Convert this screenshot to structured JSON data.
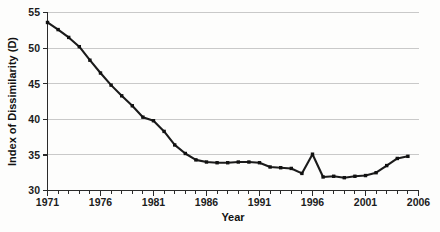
{
  "chart_data": {
    "type": "line",
    "title": "",
    "xlabel": "Year",
    "ylabel": "Index of Dissimilarity (D)",
    "xlim": [
      1971,
      2006
    ],
    "ylim": [
      30,
      55
    ],
    "grid": true,
    "grid_axis": "y",
    "legend": "none",
    "marker": "square",
    "line_color": "#1b1b1b",
    "gridline_color": "#c9c9c9",
    "background_color": "#fdfdfc",
    "x_tick_labels": [
      "1971",
      "1976",
      "1981",
      "1986",
      "1991",
      "1996",
      "2001",
      "2006"
    ],
    "x_tick_values": [
      1971,
      1976,
      1981,
      1986,
      1991,
      1996,
      2001,
      2006
    ],
    "x_minor_tick_interval": 1,
    "y_tick_labels": [
      "30",
      "35",
      "40",
      "45",
      "50",
      "55"
    ],
    "y_tick_values": [
      30,
      35,
      40,
      45,
      50,
      55
    ],
    "x": [
      1971,
      1972,
      1973,
      1974,
      1975,
      1976,
      1977,
      1978,
      1979,
      1980,
      1981,
      1982,
      1983,
      1984,
      1985,
      1986,
      1987,
      1988,
      1989,
      1990,
      1991,
      1992,
      1993,
      1994,
      1995,
      1996,
      1997,
      1998,
      1999,
      2000,
      2001,
      2002,
      2003,
      2004,
      2005
    ],
    "values": [
      53.6,
      52.6,
      51.5,
      50.2,
      48.3,
      46.5,
      44.8,
      43.3,
      41.9,
      40.3,
      39.8,
      38.3,
      36.4,
      35.2,
      34.3,
      34.0,
      33.9,
      33.9,
      34.0,
      34.0,
      33.9,
      33.3,
      33.2,
      33.1,
      32.4,
      35.1,
      31.9,
      32.0,
      31.8,
      32.0,
      32.1,
      32.5,
      33.5,
      34.5,
      34.8
    ],
    "series": [
      {
        "name": "Index of Dissimilarity (D)",
        "values": [
          53.6,
          52.6,
          51.5,
          50.2,
          48.3,
          46.5,
          44.8,
          43.3,
          41.9,
          40.3,
          39.8,
          38.3,
          36.4,
          35.2,
          34.3,
          34.0,
          33.9,
          33.9,
          34.0,
          34.0,
          33.9,
          33.3,
          33.2,
          33.1,
          32.4,
          35.1,
          31.9,
          32.0,
          31.8,
          32.0,
          32.1,
          32.5,
          33.5,
          34.5,
          34.8
        ]
      }
    ]
  }
}
